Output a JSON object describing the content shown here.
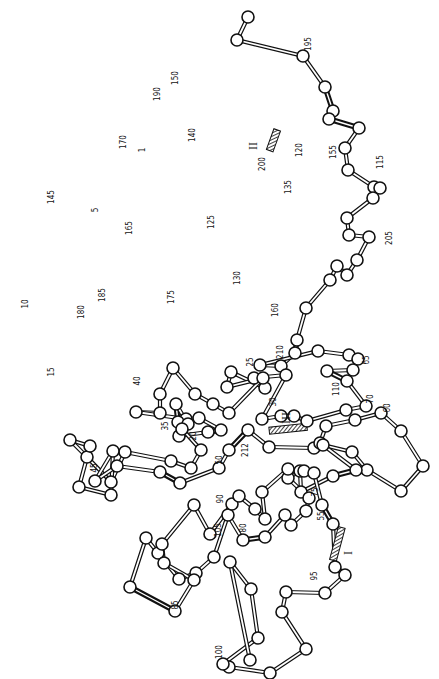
{
  "figure": {
    "colors": {
      "ink": "#111111",
      "background": "#ffffff"
    },
    "node_radius": 6
  },
  "residue_labels": [
    {
      "text": "1",
      "x": 145,
      "y": 150,
      "rot": -90
    },
    {
      "text": "5",
      "x": 98,
      "y": 210,
      "rot": -90
    },
    {
      "text": "10",
      "x": 28,
      "y": 304,
      "rot": -90
    },
    {
      "text": "15",
      "x": 54,
      "y": 372,
      "rot": -90
    },
    {
      "text": "20",
      "x": 196,
      "y": 436,
      "rot": -90
    },
    {
      "text": "25",
      "x": 253,
      "y": 362,
      "rot": -90
    },
    {
      "text": "30",
      "x": 276,
      "y": 402,
      "rot": -90
    },
    {
      "text": "35",
      "x": 168,
      "y": 426,
      "rot": -90
    },
    {
      "text": "40",
      "x": 140,
      "y": 381,
      "rot": -90
    },
    {
      "text": "45",
      "x": 97,
      "y": 468,
      "rot": -90
    },
    {
      "text": "50",
      "x": 222,
      "y": 460,
      "rot": -90
    },
    {
      "text": "55",
      "x": 324,
      "y": 516,
      "rot": -90
    },
    {
      "text": "60",
      "x": 390,
      "y": 408,
      "rot": -90
    },
    {
      "text": "65",
      "x": 369,
      "y": 360,
      "rot": -90
    },
    {
      "text": "70",
      "x": 373,
      "y": 399,
      "rot": -90
    },
    {
      "text": "75",
      "x": 318,
      "y": 492,
      "rot": -90
    },
    {
      "text": "80",
      "x": 246,
      "y": 528,
      "rot": -90
    },
    {
      "text": "85",
      "x": 178,
      "y": 605,
      "rot": -90
    },
    {
      "text": "90",
      "x": 223,
      "y": 499,
      "rot": -90
    },
    {
      "text": "95",
      "x": 317,
      "y": 576,
      "rot": -90
    },
    {
      "text": "100",
      "x": 222,
      "y": 652,
      "rot": -90
    },
    {
      "text": "105",
      "x": 221,
      "y": 530,
      "rot": -90
    },
    {
      "text": "110",
      "x": 339,
      "y": 389,
      "rot": -90
    },
    {
      "text": "115",
      "x": 383,
      "y": 162,
      "rot": -90
    },
    {
      "text": "120",
      "x": 302,
      "y": 150,
      "rot": -90
    },
    {
      "text": "125",
      "x": 214,
      "y": 222,
      "rot": -90
    },
    {
      "text": "130",
      "x": 240,
      "y": 278,
      "rot": -90
    },
    {
      "text": "135",
      "x": 291,
      "y": 187,
      "rot": -90
    },
    {
      "text": "140",
      "x": 195,
      "y": 135,
      "rot": -90
    },
    {
      "text": "145",
      "x": 54,
      "y": 197,
      "rot": -90
    },
    {
      "text": "150",
      "x": 178,
      "y": 78,
      "rot": -90
    },
    {
      "text": "155",
      "x": 336,
      "y": 152,
      "rot": -90
    },
    {
      "text": "160",
      "x": 278,
      "y": 310,
      "rot": -90
    },
    {
      "text": "165",
      "x": 132,
      "y": 228,
      "rot": -90
    },
    {
      "text": "170",
      "x": 126,
      "y": 142,
      "rot": -90
    },
    {
      "text": "175",
      "x": 174,
      "y": 297,
      "rot": -90
    },
    {
      "text": "180",
      "x": 84,
      "y": 312,
      "rot": -90
    },
    {
      "text": "185",
      "x": 105,
      "y": 295,
      "rot": -90
    },
    {
      "text": "190",
      "x": 160,
      "y": 94,
      "rot": -90
    },
    {
      "text": "195",
      "x": 311,
      "y": 44,
      "rot": -90
    },
    {
      "text": "200",
      "x": 265,
      "y": 164,
      "rot": -90
    },
    {
      "text": "205",
      "x": 392,
      "y": 238,
      "rot": -90
    },
    {
      "text": "210",
      "x": 283,
      "y": 352,
      "rot": -90
    },
    {
      "text": "212",
      "x": 248,
      "y": 450,
      "rot": -90
    }
  ],
  "disulfide_bridges": [
    {
      "label": "I",
      "x": 352,
      "y": 553
    },
    {
      "label": "II",
      "x": 257,
      "y": 146
    },
    {
      "label": "III",
      "x": 290,
      "y": 418
    }
  ],
  "nodes": [
    [
      248,
      17
    ],
    [
      237,
      40
    ],
    [
      303,
      56
    ],
    [
      325,
      87
    ],
    [
      333,
      111
    ],
    [
      329,
      119
    ],
    [
      359,
      128
    ],
    [
      345,
      148
    ],
    [
      348,
      170
    ],
    [
      374,
      187
    ],
    [
      380,
      188
    ],
    [
      373,
      198
    ],
    [
      347,
      218
    ],
    [
      349,
      235
    ],
    [
      369,
      237
    ],
    [
      357,
      260
    ],
    [
      347,
      275
    ],
    [
      337,
      266
    ],
    [
      330,
      280
    ],
    [
      306,
      308
    ],
    [
      297,
      340
    ],
    [
      295,
      353
    ],
    [
      281,
      366
    ],
    [
      260,
      365
    ],
    [
      318,
      351
    ],
    [
      349,
      355
    ],
    [
      358,
      359
    ],
    [
      353,
      370
    ],
    [
      327,
      371
    ],
    [
      347,
      381
    ],
    [
      366,
      406
    ],
    [
      346,
      410
    ],
    [
      307,
      421
    ],
    [
      294,
      416
    ],
    [
      281,
      416
    ],
    [
      262,
      419
    ],
    [
      286,
      375
    ],
    [
      254,
      378
    ],
    [
      265,
      388
    ],
    [
      231,
      372
    ],
    [
      227,
      387
    ],
    [
      263,
      378
    ],
    [
      229,
      413
    ],
    [
      213,
      404
    ],
    [
      195,
      394
    ],
    [
      173,
      368
    ],
    [
      160,
      394
    ],
    [
      160,
      413
    ],
    [
      136,
      412
    ],
    [
      186,
      419
    ],
    [
      199,
      418
    ],
    [
      221,
      430
    ],
    [
      208,
      432
    ],
    [
      179,
      436
    ],
    [
      178,
      422
    ],
    [
      176,
      404
    ],
    [
      188,
      424
    ],
    [
      182,
      429
    ],
    [
      201,
      450
    ],
    [
      191,
      468
    ],
    [
      171,
      461
    ],
    [
      125,
      452
    ],
    [
      111,
      482
    ],
    [
      87,
      457
    ],
    [
      70,
      440
    ],
    [
      90,
      446
    ],
    [
      79,
      487
    ],
    [
      111,
      495
    ],
    [
      113,
      451
    ],
    [
      95,
      481
    ],
    [
      117,
      466
    ],
    [
      160,
      472
    ],
    [
      180,
      483
    ],
    [
      219,
      468
    ],
    [
      229,
      450
    ],
    [
      248,
      430
    ],
    [
      269,
      447
    ],
    [
      314,
      448
    ],
    [
      320,
      443
    ],
    [
      326,
      426
    ],
    [
      355,
      420
    ],
    [
      381,
      413
    ],
    [
      401,
      431
    ],
    [
      423,
      466
    ],
    [
      401,
      491
    ],
    [
      367,
      470
    ],
    [
      352,
      452
    ],
    [
      323,
      445
    ],
    [
      356,
      470
    ],
    [
      333,
      476
    ],
    [
      301,
      492
    ],
    [
      300,
      471
    ],
    [
      288,
      478
    ],
    [
      309,
      498
    ],
    [
      306,
      511
    ],
    [
      291,
      525
    ],
    [
      285,
      515
    ],
    [
      265,
      537
    ],
    [
      243,
      540
    ],
    [
      228,
      515
    ],
    [
      214,
      557
    ],
    [
      196,
      573
    ],
    [
      179,
      579
    ],
    [
      158,
      553
    ],
    [
      146,
      538
    ],
    [
      130,
      587
    ],
    [
      175,
      611
    ],
    [
      194,
      580
    ],
    [
      164,
      563
    ],
    [
      162,
      544
    ],
    [
      194,
      505
    ],
    [
      210,
      534
    ],
    [
      232,
      504
    ],
    [
      239,
      496
    ],
    [
      255,
      509
    ],
    [
      265,
      519
    ],
    [
      262,
      492
    ],
    [
      288,
      469
    ],
    [
      304,
      471
    ],
    [
      314,
      473
    ],
    [
      322,
      505
    ],
    [
      333,
      524
    ],
    [
      335,
      567
    ],
    [
      345,
      575
    ],
    [
      325,
      593
    ],
    [
      286,
      592
    ],
    [
      282,
      612
    ],
    [
      306,
      649
    ],
    [
      270,
      673
    ],
    [
      229,
      667
    ],
    [
      223,
      664
    ],
    [
      258,
      638
    ],
    [
      251,
      589
    ],
    [
      230,
      562
    ],
    [
      250,
      660
    ]
  ],
  "chain_paths": "reference-only"
}
